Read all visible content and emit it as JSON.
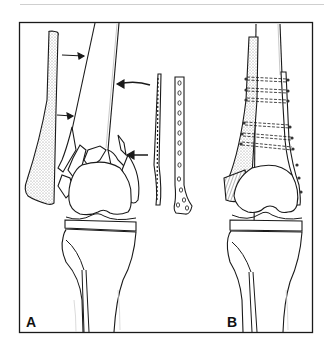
{
  "figure": {
    "panels": [
      {
        "label": "A",
        "description": "Comminuted distal femur fracture with fibular strut graft, blade plate and condylar plate shown separately; arrows indicate placement"
      },
      {
        "label": "B",
        "description": "Fixation construct assembled: fibular strut graft and lateral plate with screws through distal femur"
      }
    ],
    "colors": {
      "line": "#1a1a1a",
      "stipple": "#9a9a9a",
      "frame": "#1a1a1a",
      "topline": "#cfcfcf"
    }
  }
}
